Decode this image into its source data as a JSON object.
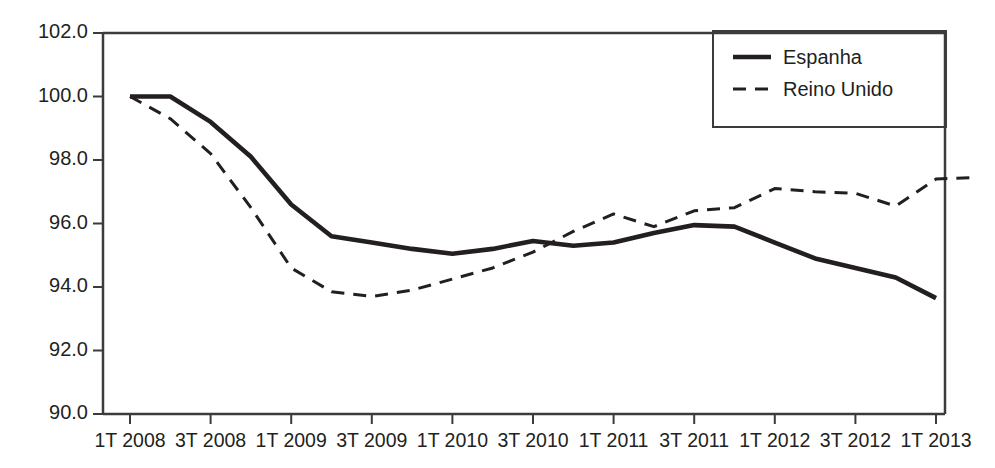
{
  "chart_data": {
    "type": "line",
    "title": "",
    "subtitle": "",
    "xlabel": "",
    "ylabel": "",
    "ylim": [
      90.0,
      102.0
    ],
    "ytick_labels": [
      "102.0",
      "100.0",
      "98.0",
      "96.0",
      "94.0",
      "92.0",
      "90.0"
    ],
    "ytick_values": [
      102.0,
      100.0,
      98.0,
      96.0,
      94.0,
      92.0,
      90.0
    ],
    "ytick_step": 2.0,
    "grid": false,
    "legend_position": "top-right",
    "x": [
      "1T 2008",
      "2T 2008",
      "3T 2008",
      "4T 2008",
      "1T 2009",
      "2T 2009",
      "3T 2009",
      "4T 2009",
      "1T 2010",
      "2T 2010",
      "3T 2010",
      "4T 2010",
      "1T 2011",
      "2T 2011",
      "3T 2011",
      "4T 2011",
      "1T 2012",
      "2T 2012",
      "3T 2012",
      "4T 2012",
      "1T 2013",
      "2T 2013"
    ],
    "xtick_labels": [
      "1T 2008",
      "3T 2008",
      "1T 2009",
      "3T 2009",
      "1T 2010",
      "3T 2010",
      "1T 2011",
      "3T 2011",
      "1T 2012",
      "3T 2012",
      "1T 2013"
    ],
    "series": [
      {
        "name": "Espanha",
        "style": "solid",
        "color": "#231f20",
        "values": [
          100.0,
          100.0,
          99.2,
          98.1,
          96.6,
          95.6,
          95.4,
          95.2,
          95.05,
          95.2,
          95.45,
          95.3,
          95.4,
          95.7,
          95.95,
          95.9,
          95.4,
          94.9,
          94.6,
          94.3,
          93.65,
          null
        ]
      },
      {
        "name": "Reino Unido",
        "style": "dashed",
        "color": "#231f20",
        "values": [
          100.0,
          99.3,
          98.2,
          96.5,
          94.6,
          93.85,
          93.7,
          93.9,
          94.25,
          94.6,
          95.1,
          95.75,
          96.3,
          95.9,
          96.4,
          96.5,
          97.1,
          97.0,
          96.95,
          96.55,
          97.4,
          97.45
        ]
      }
    ]
  },
  "legend": {
    "items": [
      {
        "label": "Espanha",
        "style": "solid"
      },
      {
        "label": "Reino Unido",
        "style": "dashed"
      }
    ]
  },
  "axis": {
    "y_min_label": "90.0",
    "y_max_label": "102.0"
  }
}
